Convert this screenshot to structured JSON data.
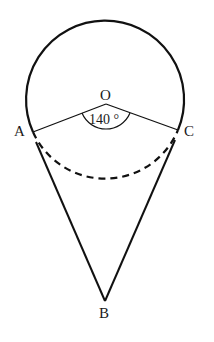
{
  "figure": {
    "type": "geometry-diagram",
    "points": {
      "O": {
        "label": "O"
      },
      "A": {
        "label": "A"
      },
      "C": {
        "label": "C"
      },
      "B": {
        "label": "B"
      }
    },
    "angle_label": "140 °",
    "colors": {
      "stroke": "#111111",
      "background": "#ffffff"
    }
  }
}
